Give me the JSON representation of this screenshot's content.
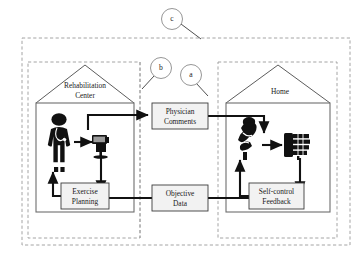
{
  "figure": {
    "background_color": "#ffffff"
  },
  "callouts": [
    {
      "id": "a",
      "label": "a",
      "cx": 191,
      "cy": 75,
      "r": 10.5,
      "leader": {
        "x1": 196,
        "y1": 84,
        "x2": 206,
        "y2": 96
      },
      "points_to": "home-dashed-zone"
    },
    {
      "id": "b",
      "label": "b",
      "cx": 161,
      "cy": 68,
      "r": 10.5,
      "leader": {
        "x1": 155,
        "y1": 77,
        "x2": 143,
        "y2": 88
      },
      "points_to": "middle-channel-divider"
    },
    {
      "id": "c",
      "label": "c",
      "cx": 172,
      "cy": 19,
      "r": 10.5,
      "leader": {
        "x1": 180,
        "y1": 24,
        "x2": 200,
        "y2": 38
      },
      "points_to": "outer-dashed-boundary"
    }
  ],
  "zones": {
    "outer": {
      "x": 22,
      "y": 38,
      "w": 328,
      "h": 207,
      "name": "overall-system-boundary"
    },
    "rehab": {
      "x": 28,
      "y": 62,
      "w": 112,
      "h": 176,
      "name": "rehabilitation-center-zone"
    },
    "home": {
      "x": 218,
      "y": 62,
      "w": 119,
      "h": 176,
      "name": "home-zone"
    },
    "divider_x": 140
  },
  "houses": [
    {
      "id": "rehabilitation-center",
      "label": "Rehabilitation\nCenter",
      "label_line1": "Rehabilitation",
      "label_line2": "Center",
      "x": 36,
      "y": 65,
      "w": 98,
      "h": 147,
      "roof_h": 38
    },
    {
      "id": "home",
      "label": "Home",
      "label_line1": "Home",
      "label_line2": "",
      "x": 226,
      "y": 65,
      "w": 104,
      "h": 147,
      "roof_h": 38
    }
  ],
  "nodes": [
    {
      "id": "physician-comments",
      "line1": "Physician",
      "line2": "Comments",
      "x": 152,
      "y": 103,
      "w": 56,
      "h": 26
    },
    {
      "id": "objective-data",
      "line1": "Objective",
      "line2": "Data",
      "x": 152,
      "y": 185,
      "w": 56,
      "h": 26
    },
    {
      "id": "exercise-planning",
      "line1": "Exercise",
      "line2": "Planning",
      "x": 61,
      "y": 183,
      "w": 48,
      "h": 26
    },
    {
      "id": "self-control-feedback",
      "line1": "Self-control",
      "line2": "Feedback",
      "x": 249,
      "y": 183,
      "w": 55,
      "h": 26
    }
  ],
  "actors": [
    {
      "id": "physician-figure",
      "label": "physician",
      "x": 52,
      "y": 117
    },
    {
      "id": "clinic-workstation",
      "label": "workstation",
      "x": 100,
      "y": 138
    },
    {
      "id": "patient-figure",
      "label": "patient",
      "x": 245,
      "y": 128
    },
    {
      "id": "rehab-device",
      "label": "hand-rehabilitation-device",
      "x": 296,
      "y": 140
    }
  ],
  "flows": [
    {
      "id": "physician-to-workstation",
      "from": "physician-figure",
      "to": "clinic-workstation"
    },
    {
      "id": "workstation-to-physician-comments",
      "from": "clinic-workstation",
      "to": "physician-comments"
    },
    {
      "id": "physician-comments-to-patient-device",
      "from": "physician-comments",
      "to": "rehab-device"
    },
    {
      "id": "patient-to-rehab-device",
      "from": "patient-figure",
      "to": "rehab-device"
    },
    {
      "id": "rehab-device-to-self-control-feedback",
      "from": "rehab-device",
      "to": "self-control-feedback"
    },
    {
      "id": "self-control-feedback-to-patient",
      "from": "self-control-feedback",
      "to": "patient-figure"
    },
    {
      "id": "self-control-feedback-to-objective-data",
      "from": "self-control-feedback",
      "to": "objective-data"
    },
    {
      "id": "objective-data-to-exercise-planning",
      "from": "objective-data",
      "to": "exercise-planning"
    },
    {
      "id": "workstation-to-exercise-planning",
      "from": "clinic-workstation",
      "to": "exercise-planning"
    },
    {
      "id": "exercise-planning-to-physician",
      "from": "exercise-planning",
      "to": "physician-figure"
    }
  ],
  "colors": {
    "ink": "#111111",
    "dashed": "#9a9a9a",
    "house_stroke": "#4a4a4a",
    "box_fill": "#f2f2f2",
    "box_stroke": "#3c3c3c"
  }
}
